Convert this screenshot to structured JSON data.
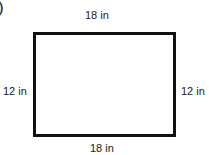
{
  "figure": {
    "part_marker": ")",
    "shape": "rectangle",
    "labels": {
      "top": "18 in",
      "bottom": "18 in",
      "left": "12 in",
      "right": "12 in"
    },
    "stroke_color": "#111111"
  }
}
